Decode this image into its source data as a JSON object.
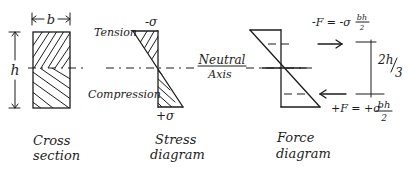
{
  "cross_section": {
    "width_label": "b",
    "height_label": "h",
    "caption_line1": "Cross",
    "caption_line2": "section"
  },
  "stress_diagram": {
    "top_label": "-σ",
    "bottom_label": "+σ",
    "tension_label": "Tension",
    "compression_label": "Compression",
    "caption_line1": "Stress",
    "caption_line2": "diagram"
  },
  "neutral_axis": {
    "line1": "Neutral",
    "line2": "Axis"
  },
  "force_diagram": {
    "top_force": "-F = -σ",
    "top_force_frac_num": "bh",
    "top_force_frac_den": "2",
    "bottom_force": "+F = +σ",
    "bottom_force_frac_num": "bh",
    "bottom_force_frac_den": "2",
    "lever_arm_num": "2h",
    "lever_arm_den": "3",
    "caption_line1": "Force",
    "caption_line2": "diagram"
  }
}
